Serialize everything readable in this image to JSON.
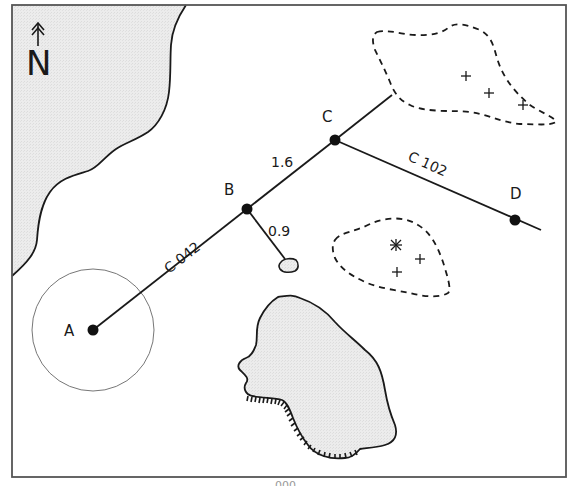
{
  "diagram": {
    "type": "navigation-chart",
    "north_arrow": {
      "label": "N",
      "icon": "north-arrow-icon"
    },
    "waypoints": [
      {
        "id": "A",
        "label": "A",
        "x": 93,
        "y": 330
      },
      {
        "id": "B",
        "label": "B",
        "x": 247,
        "y": 209
      },
      {
        "id": "C",
        "label": "C",
        "x": 335,
        "y": 140
      },
      {
        "id": "D",
        "label": "D",
        "x": 515,
        "y": 220
      }
    ],
    "legs": [
      {
        "from": "A",
        "to": "B",
        "label": "C 042"
      },
      {
        "from": "B",
        "to": "C",
        "label": "1.6"
      },
      {
        "from": "C",
        "to": "D",
        "label": "C 102"
      },
      {
        "from": "B",
        "to": "rock",
        "label": "0.9"
      }
    ],
    "labels": {
      "a": "A",
      "b": "B",
      "c": "C",
      "d": "D",
      "course_ab": "C 042",
      "dist_bc": "1.6",
      "course_cd": "C 102",
      "dist_b_rock": "0.9"
    },
    "features": {
      "coastline": "land-mass-top-left",
      "island": "island-with-cliff",
      "rock": "small-rock",
      "danger_area_north": {
        "symbols": [
          "+",
          "+",
          "+"
        ]
      },
      "danger_area_south": {
        "symbols": [
          "*",
          "+",
          "+"
        ]
      },
      "range_circle": "circle-around-A"
    },
    "colors": {
      "land_fill": "#e9e9e9",
      "line": "#1a1a1a",
      "frame": "#555555",
      "circle": "#777777"
    },
    "caption": "000"
  }
}
